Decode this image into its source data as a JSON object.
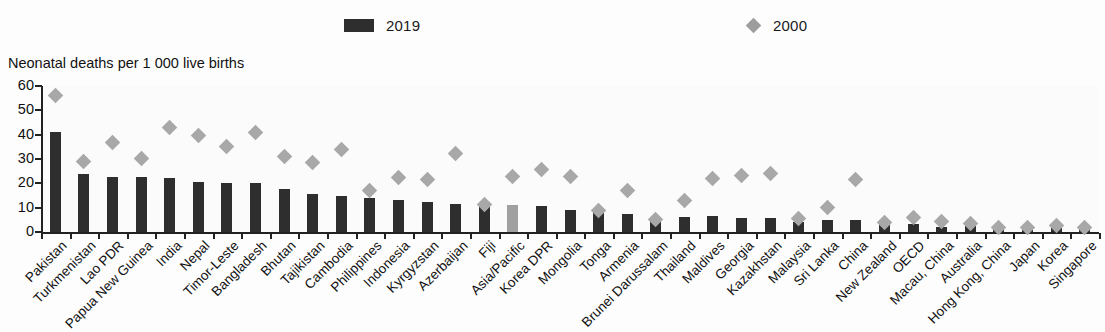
{
  "chart_data": {
    "type": "bar",
    "title": "",
    "ylabel": "Neonatal deaths per 1 000 live births",
    "xlabel": "",
    "ylim": [
      0,
      60
    ],
    "yticks": [
      0,
      10,
      20,
      30,
      40,
      50,
      60
    ],
    "ytick_labels": [
      "0",
      "10",
      "20",
      "30",
      "40",
      "50",
      "60"
    ],
    "grid": false,
    "legend_position": "top-center",
    "legend": [
      {
        "name": "2019",
        "marker": "bar",
        "color": "#2e2e2e"
      },
      {
        "name": "2000",
        "marker": "diamond",
        "color": "#a8a8a8"
      }
    ],
    "highlight_category": "Asia/Pacific",
    "highlight_color": "#a0a0a0",
    "categories": [
      "Pakistan",
      "Turkmenistan",
      "Lao PDR",
      "Papua New Guinea",
      "India",
      "Nepal",
      "Timor-Leste",
      "Bangladesh",
      "Bhutan",
      "Tajikistan",
      "Cambodia",
      "Philippines",
      "Indonesia",
      "Kyrgyzstan",
      "Azerbaijan",
      "Fiji",
      "Asia/Pacific",
      "Korea DPR",
      "Mongolia",
      "Tonga",
      "Armenia",
      "Brunei Darussalam",
      "Thailand",
      "Maldives",
      "Georgia",
      "Kazakhstan",
      "Malaysia",
      "Sri Lanka",
      "China",
      "New Zealand",
      "OECD",
      "Macau, China",
      "Australia",
      "Hong Kong, China",
      "Japan",
      "Korea",
      "Singapore"
    ],
    "series": [
      {
        "name": "2019",
        "marker": "bar",
        "values": [
          41.2,
          24.0,
          22.4,
          22.5,
          22.0,
          20.6,
          20.3,
          20.1,
          17.6,
          15.7,
          14.8,
          13.9,
          13.0,
          12.4,
          11.4,
          10.9,
          11.0,
          10.5,
          9.2,
          8.3,
          7.6,
          6.0,
          6.2,
          6.4,
          5.9,
          5.9,
          4.1,
          4.8,
          5.0,
          3.3,
          3.4,
          2.2,
          2.3,
          1.1,
          0.9,
          1.5,
          1.1
        ]
      },
      {
        "name": "2000",
        "marker": "diamond",
        "values": [
          56.0,
          28.8,
          36.7,
          30.2,
          43.0,
          39.6,
          35.2,
          41.0,
          31.0,
          28.6,
          33.7,
          17.1,
          22.6,
          21.4,
          32.3,
          11.3,
          23.0,
          25.6,
          23.0,
          9.0,
          17.1,
          5.2,
          12.8,
          21.8,
          23.1,
          23.9,
          5.5,
          10.2,
          21.5,
          3.9,
          6.0,
          4.4,
          3.6,
          1.7,
          1.8,
          2.7,
          1.7
        ]
      }
    ]
  },
  "axis_title": "Neonatal deaths per 1 000 live births"
}
